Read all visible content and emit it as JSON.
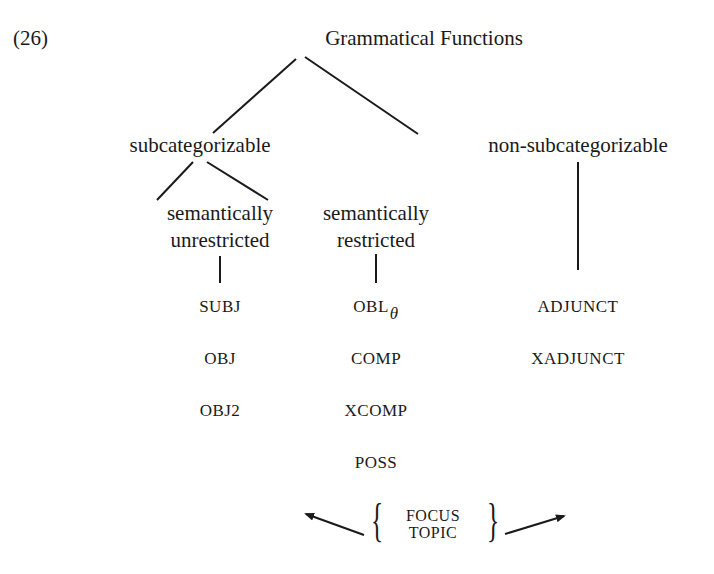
{
  "example_number": "(26)",
  "root": "Grammatical Functions",
  "level1": {
    "left": "subcategorizable",
    "right": "non-subcategorizable"
  },
  "level2": {
    "unrestricted": [
      "semantically",
      "unrestricted"
    ],
    "restricted": [
      "semantically",
      "restricted"
    ]
  },
  "functions": {
    "unrestricted": [
      "SUBJ",
      "OBJ",
      "OBJ2"
    ],
    "restricted": [
      "OBL",
      "COMP",
      "XCOMP",
      "POSS"
    ],
    "restricted_subscript": "θ",
    "non_subcategorizable": [
      "ADJUNCT",
      "XADJUNCT"
    ]
  },
  "discourse": [
    "FOCUS",
    "TOPIC"
  ]
}
